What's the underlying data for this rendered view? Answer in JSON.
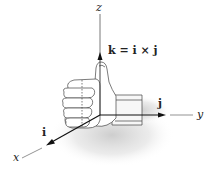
{
  "figure": {
    "axes": {
      "x": {
        "label": "x"
      },
      "y": {
        "label": "y"
      },
      "z": {
        "label": "z"
      }
    },
    "vectors": {
      "i": {
        "label": "i"
      },
      "j": {
        "label": "j"
      },
      "k": {
        "label": "k = i × j"
      }
    },
    "colors": {
      "axis_line": "#555555",
      "vector": "#111111",
      "shadow": "#cfcfcf",
      "hand_outline": "#444444"
    }
  }
}
